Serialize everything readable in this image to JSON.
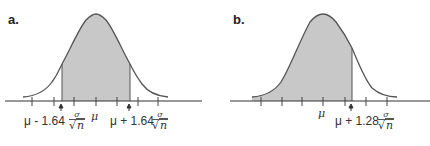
{
  "panels": [
    {
      "label": "a.",
      "mu_label": "μ",
      "left_label": "μ - 1.64",
      "right_label": "μ + 1.64",
      "frac_num": "σ",
      "frac_den_root": "√",
      "frac_den_var": "n",
      "shaded_region": "between μ - 1.64σ/√n and μ + 1.64σ/√n"
    },
    {
      "label": "b.",
      "mu_label": "μ",
      "right_label": "μ + 1.28",
      "frac_num": "σ",
      "frac_den_root": "√",
      "frac_den_var": "n",
      "shaded_region": "below μ + 1.28σ/√n"
    }
  ],
  "colors": {
    "shade": "#c8c8c8",
    "line": "#555555"
  }
}
